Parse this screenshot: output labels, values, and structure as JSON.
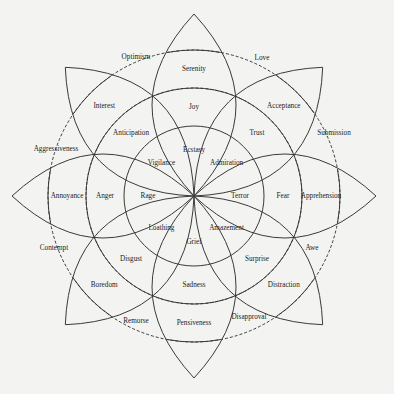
{
  "diagram": {
    "center": [
      194,
      196
    ],
    "petals": [
      {
        "angle": -90,
        "outer": "Serenity",
        "middle": "Joy",
        "inner": "Ecstasy"
      },
      {
        "angle": -45,
        "outer": "Acceptance",
        "middle": "Trust",
        "inner": "Admiration"
      },
      {
        "angle": 0,
        "outer": "Apprehension",
        "middle": "Fear",
        "inner": "Terror"
      },
      {
        "angle": 45,
        "outer": "Distraction",
        "middle": "Surprise",
        "inner": "Amazement"
      },
      {
        "angle": 90,
        "outer": "Pensiveness",
        "middle": "Sadness",
        "inner": "Grief"
      },
      {
        "angle": 135,
        "outer": "Boredom",
        "middle": "Disgust",
        "inner": "Loathing"
      },
      {
        "angle": 180,
        "outer": "Annoyance",
        "middle": "Anger",
        "inner": "Rage"
      },
      {
        "angle": -135,
        "outer": "Interest",
        "middle": "Anticipation",
        "inner": "Vigilance"
      }
    ],
    "dyads": [
      {
        "label": "Love",
        "pos": [
          262,
          58
        ]
      },
      {
        "label": "Submission",
        "pos": [
          334,
          133
        ]
      },
      {
        "label": "Awe",
        "pos": [
          312,
          248
        ]
      },
      {
        "label": "Disapproval",
        "pos": [
          249,
          317
        ]
      },
      {
        "label": "Remorse",
        "pos": [
          136,
          321
        ]
      },
      {
        "label": "Contempt",
        "pos": [
          54,
          248
        ]
      },
      {
        "label": "Aggressiveness",
        "pos": [
          56,
          149
        ]
      },
      {
        "label": "Optimism",
        "pos": [
          136,
          57
        ]
      }
    ]
  }
}
